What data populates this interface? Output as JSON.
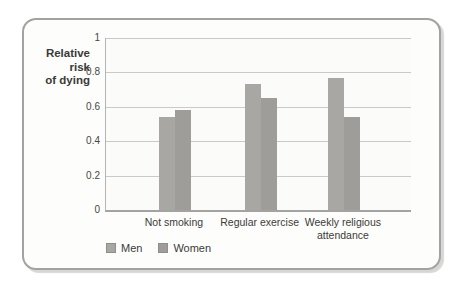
{
  "chart_data": {
    "type": "bar",
    "title": "",
    "xlabel": "",
    "ylabel": "Relative risk of dying",
    "ylabel_display": "Relative\nrisk\nof dying",
    "categories": [
      "Not smoking",
      "Regular exercise",
      "Weekly religious attendance"
    ],
    "series": [
      {
        "name": "Men",
        "color": "#a8a7a3",
        "values": [
          0.54,
          0.73,
          0.77
        ]
      },
      {
        "name": "Women",
        "color": "#9e9d99",
        "values": [
          0.58,
          0.65,
          0.54
        ]
      }
    ],
    "ylim": [
      0,
      1
    ],
    "yticks": [
      0,
      0.2,
      0.4,
      0.6,
      0.8,
      1
    ],
    "ytick_labels": [
      "0",
      "0.2",
      "0.4",
      "0.6",
      "0.8",
      "1"
    ],
    "grid": true,
    "legend_position": "bottom-left",
    "group_centers_frac": [
      0.226,
      0.507,
      0.78
    ],
    "bar_width_px": 16
  },
  "colors": {
    "card_border": "#a2a2a0",
    "gridline": "#c9c9c7",
    "axis_line": "#a3a3a1",
    "text": "#3b3b39"
  }
}
